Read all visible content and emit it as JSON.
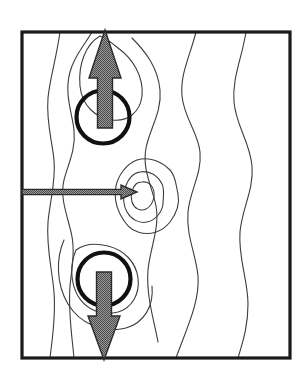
{
  "figure": {
    "canvas": {
      "width": 307,
      "height": 381
    },
    "background_color": "#ffffff"
  },
  "frame": {
    "name": "plot-border",
    "x": 22,
    "y": 32,
    "width": 268,
    "height": 326,
    "stroke_color": "#1a1a1a",
    "stroke_width": 3.2,
    "fill": "none"
  },
  "style": {
    "contour_stroke": "#3d3d3d",
    "contour_width": 1.1,
    "circle_stroke": "#111111",
    "circle_width": 4.2,
    "arrow_fill": "#8a8a8a",
    "arrow_stroke": "#2b2b2b",
    "arrow_stroke_width": 1.4,
    "hatch_dot_color": "#4a4a4a"
  },
  "circles": [
    {
      "name": "upper-vortex-circle",
      "label": "upper circle",
      "cx": 103,
      "cy": 117,
      "r": 26.5
    },
    {
      "name": "lower-vortex-circle",
      "label": "lower circle",
      "cx": 104,
      "cy": 279,
      "r": 26.5
    }
  ],
  "arrows": [
    {
      "name": "upward-arrow",
      "label": "upward arrow",
      "direction": "up",
      "tail_x": 105,
      "tail_y": 128,
      "head_x": 105,
      "head_y": 30,
      "shaft_half_width": 7.5,
      "head_half_width": 16,
      "head_length": 48
    },
    {
      "name": "downward-arrow",
      "label": "downward arrow",
      "direction": "down",
      "tail_x": 104,
      "tail_y": 272,
      "head_x": 104,
      "head_y": 360,
      "shaft_half_width": 7.5,
      "head_half_width": 16,
      "head_length": 44
    },
    {
      "name": "leftward-inflow-arrow",
      "label": "horizontal arrow",
      "direction": "right",
      "tail_x": 22,
      "tail_y": 192,
      "head_x": 137,
      "head_y": 192,
      "shaft_half_width": 2.6,
      "head_half_width": 7,
      "head_length": 16
    }
  ],
  "chart_data": {
    "type": "contour",
    "xlabel": "",
    "ylabel": "",
    "grid": false,
    "legend": "none",
    "xlim": [
      22,
      290
    ],
    "ylim": [
      32,
      358
    ],
    "contours": [
      {
        "name": "left-outer-contour",
        "level": 1,
        "closed": false,
        "path": "M 60 32 C 56 60, 50 78, 48 98 C 46 122, 52 140, 54 160 C 56 182, 50 200, 48 222 C 46 248, 52 268, 54 292 C 56 318, 52 340, 50 358"
      },
      {
        "name": "left-mid-contour",
        "level": 2,
        "closed": false,
        "path": "M 92 32 C 84 46, 74 56, 70 72 C 64 94, 72 112, 74 130 C 76 150, 68 164, 64 180 C 60 196, 66 212, 70 228 C 76 248, 72 266, 70 286 C 68 312, 72 336, 74 358"
      },
      {
        "name": "upper-lobe-contour",
        "level": 3,
        "closed": false,
        "path": "M 100 36 C 86 44, 78 64, 80 86 C 82 106, 96 118, 112 120 C 128 122, 140 112, 142 96 C 144 76, 132 58, 118 48 C 112 43, 106 38, 100 36"
      },
      {
        "name": "upper-right-sweep-contour",
        "level": 3,
        "closed": false,
        "path": "M 132 38 C 146 52, 158 68, 160 90 C 162 112, 150 128, 146 148 C 142 170, 152 186, 156 206 C 160 228, 150 248, 148 270 C 146 296, 154 320, 158 342"
      },
      {
        "name": "right-mid-contour",
        "level": 2,
        "closed": false,
        "path": "M 196 32 C 190 56, 180 74, 182 96 C 184 118, 198 132, 200 152 C 202 174, 190 190, 188 212 C 186 236, 196 254, 198 276 C 200 302, 186 330, 176 358"
      },
      {
        "name": "right-outer-contour",
        "level": 1,
        "closed": false,
        "path": "M 246 32 C 242 58, 232 78, 234 102 C 236 126, 250 142, 252 166 C 254 190, 242 208, 240 232 C 238 258, 248 280, 248 304 C 248 328, 242 344, 238 358"
      },
      {
        "name": "center-contour-outer",
        "level": 4,
        "closed": true,
        "path": "M 137 160 C 150 156, 162 162, 170 170 C 176 176, 176 186, 178 194 C 180 204, 176 214, 170 222 C 162 232, 150 236, 138 232 C 130 230, 124 222, 120 214 C 116 206, 114 196, 116 186 C 118 176, 126 164, 137 160 Z"
      },
      {
        "name": "center-contour-middle",
        "level": 5,
        "closed": true,
        "path": "M 140 172 C 150 170, 158 176, 162 184 C 165 190, 163 198, 163 204 C 162 212, 156 220, 147 222 C 139 224, 131 219, 127 212 C 123 205, 123 196, 125 188 C 128 179, 133 173, 140 172 Z"
      },
      {
        "name": "center-contour-inner",
        "level": 6,
        "closed": true,
        "path": "M 142 182 C 149 181, 153 186, 154 192 C 155 198, 152 206, 146 209 C 140 212, 134 208, 132 202 C 130 196, 132 188, 136 184 C 138 182, 140 182, 142 182 Z"
      },
      {
        "name": "lower-lobe-contour",
        "level": 3,
        "closed": false,
        "path": "M 76 250 C 70 264, 70 282, 78 296 C 86 310, 102 316, 118 312 C 132 308, 140 294, 138 278 C 136 262, 124 250, 108 246 C 96 243, 84 244, 76 250"
      },
      {
        "name": "lower-outer-lobe-contour",
        "level": 2,
        "closed": false,
        "path": "M 64 240 C 56 258, 56 284, 68 304 C 80 324, 104 334, 126 328 C 144 323, 154 306, 152 286"
      }
    ],
    "annotations": [
      {
        "name": "upward-arrow",
        "type": "arrow",
        "direction": "up",
        "at": [
          105,
          117
        ]
      },
      {
        "name": "downward-arrow",
        "type": "arrow",
        "direction": "down",
        "at": [
          104,
          279
        ]
      },
      {
        "name": "leftward-inflow-arrow",
        "type": "arrow",
        "direction": "right",
        "at": [
          80,
          192
        ]
      }
    ]
  }
}
